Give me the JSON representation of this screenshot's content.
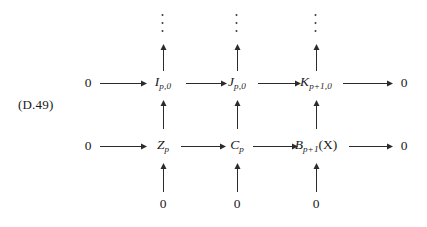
{
  "label": {
    "tag": "(D.49)"
  },
  "columns": {
    "x": [
      88,
      163,
      237,
      316,
      404
    ]
  },
  "rows": {
    "y": [
      25,
      83,
      146,
      204
    ]
  },
  "nodes": {
    "row_top": [
      {
        "name": "zero-left-top",
        "text": "0",
        "kind": "zero",
        "col": 0
      },
      {
        "name": "node-I-p-0",
        "base": "I",
        "sub": "p,0",
        "kind": "math",
        "col": 1
      },
      {
        "name": "node-J-p-0",
        "base": "J",
        "sub": "p,0",
        "kind": "math",
        "col": 2
      },
      {
        "name": "node-K-p1-0",
        "base": "K",
        "sub": "p+1,0",
        "kind": "math",
        "col": 3
      },
      {
        "name": "zero-right-top",
        "text": "0",
        "kind": "zero",
        "col": 4
      }
    ],
    "row_bottom": [
      {
        "name": "zero-left-bottom",
        "text": "0",
        "kind": "zero",
        "col": 0
      },
      {
        "name": "node-Z-p",
        "base": "Z",
        "sub": "p",
        "kind": "math",
        "col": 1
      },
      {
        "name": "node-C-p",
        "base": "C",
        "sub": "p",
        "kind": "math",
        "col": 2
      },
      {
        "name": "node-B-p1-X",
        "base": "B",
        "sub": "p+1",
        "suffix": "(X)",
        "kind": "math",
        "col": 3
      },
      {
        "name": "zero-right-bottom",
        "text": "0",
        "kind": "zero",
        "col": 4
      }
    ],
    "row_zeros": [
      {
        "name": "zero-bottom-col1",
        "text": "0",
        "col": 1
      },
      {
        "name": "zero-bottom-col2",
        "text": "0",
        "col": 2
      },
      {
        "name": "zero-bottom-col3",
        "text": "0",
        "col": 3
      }
    ]
  },
  "dots": {
    "glyph": "vertical-ellipsis",
    "columns": [
      1,
      2,
      3
    ]
  },
  "arrows": {
    "horizontal_count": 8,
    "vertical_count": 9,
    "direction_horizontal": "right",
    "direction_vertical": "up",
    "color": "#2b2b2b"
  },
  "style": {
    "background": "#ffffff",
    "ink": "#1a1a1a"
  }
}
